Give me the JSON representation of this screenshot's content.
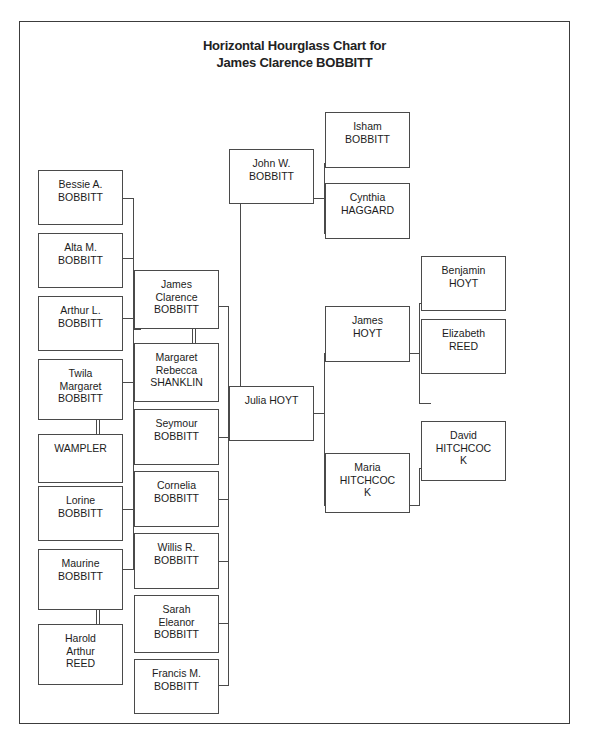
{
  "chart": {
    "title_line1": "Horizontal Hourglass Chart for",
    "title_line2": "James Clarence BOBBITT",
    "root": "James Clarence BOBBITT",
    "type": "hourglass-genealogy",
    "border_color": "#3c3c3c",
    "box_border_color": "#4a4a4a",
    "background": "#ffffff"
  },
  "descendants_col1": [
    {
      "id": "bessie",
      "name": "Bessie A.\nBOBBITT"
    },
    {
      "id": "alta",
      "name": "Alta M.\nBOBBITT"
    },
    {
      "id": "arthur",
      "name": "Arthur L.\nBOBBITT"
    },
    {
      "id": "twila",
      "name": "Twila\nMargaret\nBOBBITT"
    },
    {
      "id": "wampler",
      "name": "WAMPLER"
    },
    {
      "id": "lorine",
      "name": "Lorine\nBOBBITT"
    },
    {
      "id": "maurine",
      "name": "Maurine\nBOBBITT"
    },
    {
      "id": "harold",
      "name": "Harold\nArthur\nREED"
    }
  ],
  "center_col2": [
    {
      "id": "james_clarence",
      "name": "James\nClarence\nBOBBITT"
    },
    {
      "id": "margaret",
      "name": "Margaret\nRebecca\nSHANKLIN"
    },
    {
      "id": "seymour",
      "name": "Seymour\nBOBBITT"
    },
    {
      "id": "cornelia",
      "name": "Cornelia\nBOBBITT"
    },
    {
      "id": "willis",
      "name": "Willis R.\nBOBBITT"
    },
    {
      "id": "sarah",
      "name": "Sarah\nEleanor\nBOBBITT"
    },
    {
      "id": "francis",
      "name": "Francis M.\nBOBBITT"
    }
  ],
  "parents_col3": [
    {
      "id": "john_w",
      "name": "John W.\nBOBBITT"
    },
    {
      "id": "julia",
      "name": "Julia HOYT"
    }
  ],
  "grandparents_col4": [
    {
      "id": "isham",
      "name": "Isham\nBOBBITT"
    },
    {
      "id": "cynthia",
      "name": "Cynthia\nHAGGARD"
    },
    {
      "id": "james_h",
      "name": "James\nHOYT"
    },
    {
      "id": "maria",
      "name": "Maria\nHITCHCOC\nK"
    }
  ],
  "greatgrandparents_col5": [
    {
      "id": "benjamin",
      "name": "Benjamin\nHOYT"
    },
    {
      "id": "elizabeth",
      "name": "Elizabeth\nREED"
    },
    {
      "id": "david",
      "name": "David\nHITCHCOC\nK"
    }
  ]
}
